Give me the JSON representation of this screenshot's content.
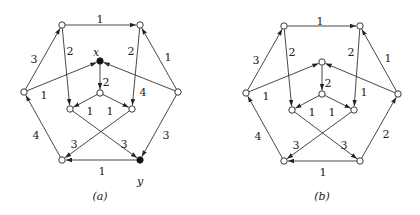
{
  "graphs": [
    {
      "id": "a",
      "caption": "(a)",
      "offset_x": 0,
      "nodes": [
        {
          "id": "tl",
          "x": 62,
          "y": 25,
          "filled": false
        },
        {
          "id": "tr",
          "x": 140,
          "y": 25,
          "filled": false
        },
        {
          "id": "l",
          "x": 24,
          "y": 92,
          "filled": false
        },
        {
          "id": "r",
          "x": 178,
          "y": 92,
          "filled": false
        },
        {
          "id": "x",
          "x": 100,
          "y": 61,
          "filled": true,
          "label": "x",
          "lx": 96,
          "ly": 53
        },
        {
          "id": "c",
          "x": 100,
          "y": 93,
          "filled": false
        },
        {
          "id": "il",
          "x": 70,
          "y": 109,
          "filled": false
        },
        {
          "id": "ir",
          "x": 132,
          "y": 109,
          "filled": false
        },
        {
          "id": "bl",
          "x": 62,
          "y": 160,
          "filled": false
        },
        {
          "id": "y",
          "x": 140,
          "y": 160,
          "filled": true,
          "label": "y",
          "lx": 140,
          "ly": 182
        }
      ],
      "edges": [
        {
          "from": "tl",
          "to": "tr",
          "w": "1",
          "lx": 100,
          "ly": 20
        },
        {
          "from": "l",
          "to": "tl",
          "w": "3",
          "lx": 34,
          "ly": 60
        },
        {
          "from": "r",
          "to": "tr",
          "w": "1",
          "lx": 168,
          "ly": 58
        },
        {
          "from": "tl",
          "to": "il",
          "w": "2",
          "lx": 70,
          "ly": 52
        },
        {
          "from": "tr",
          "to": "ir",
          "w": "2",
          "lx": 131,
          "ly": 52
        },
        {
          "from": "l",
          "to": "x",
          "w": "1",
          "lx": 44,
          "ly": 96
        },
        {
          "from": "r",
          "to": "x",
          "w": "4",
          "lx": 143,
          "ly": 93
        },
        {
          "from": "x",
          "to": "c",
          "w": "2",
          "lx": 106,
          "ly": 83
        },
        {
          "from": "c",
          "to": "il",
          "w": "1",
          "lx": 90,
          "ly": 112
        },
        {
          "from": "c",
          "to": "ir",
          "w": "1",
          "lx": 110,
          "ly": 112
        },
        {
          "from": "bl",
          "to": "l",
          "w": "4",
          "lx": 36,
          "ly": 136
        },
        {
          "from": "r",
          "to": "y",
          "w": "3",
          "lx": 166,
          "ly": 136
        },
        {
          "from": "il",
          "to": "y",
          "w": "3",
          "lx": 124,
          "ly": 145
        },
        {
          "from": "ir",
          "to": "bl",
          "w": "3",
          "lx": 74,
          "ly": 145
        },
        {
          "from": "y",
          "to": "bl",
          "w": "1",
          "lx": 102,
          "ly": 172
        }
      ]
    },
    {
      "id": "b",
      "caption": "(b)",
      "offset_x": 210,
      "nodes": [
        {
          "id": "tl",
          "x": 74,
          "y": 26,
          "filled": false
        },
        {
          "id": "tr",
          "x": 150,
          "y": 26,
          "filled": false
        },
        {
          "id": "l",
          "x": 36,
          "y": 93,
          "filled": false
        },
        {
          "id": "r",
          "x": 188,
          "y": 94,
          "filled": false
        },
        {
          "id": "t",
          "x": 112,
          "y": 62,
          "filled": false
        },
        {
          "id": "c",
          "x": 112,
          "y": 94,
          "filled": false
        },
        {
          "id": "il",
          "x": 82,
          "y": 110,
          "filled": false
        },
        {
          "id": "ir",
          "x": 144,
          "y": 110,
          "filled": false
        },
        {
          "id": "bl",
          "x": 74,
          "y": 161,
          "filled": false
        },
        {
          "id": "br",
          "x": 150,
          "y": 161,
          "filled": false
        }
      ],
      "edges": [
        {
          "from": "tl",
          "to": "tr",
          "w": "1",
          "lx": 110,
          "ly": 22
        },
        {
          "from": "l",
          "to": "tl",
          "w": "3",
          "lx": 46,
          "ly": 61
        },
        {
          "from": "r",
          "to": "tr",
          "w": "1",
          "lx": 178,
          "ly": 59
        },
        {
          "from": "tl",
          "to": "il",
          "w": "2",
          "lx": 82,
          "ly": 53
        },
        {
          "from": "tr",
          "to": "ir",
          "w": "2",
          "lx": 141,
          "ly": 53
        },
        {
          "from": "l",
          "to": "t",
          "w": "1",
          "lx": 56,
          "ly": 97
        },
        {
          "from": "r",
          "to": "t",
          "w": "1",
          "lx": 154,
          "ly": 93
        },
        {
          "from": "t",
          "to": "c",
          "w": "2",
          "lx": 118,
          "ly": 84
        },
        {
          "from": "c",
          "to": "il",
          "w": "1",
          "lx": 102,
          "ly": 113
        },
        {
          "from": "c",
          "to": "ir",
          "w": "1",
          "lx": 122,
          "ly": 113
        },
        {
          "from": "bl",
          "to": "l",
          "w": "4",
          "lx": 48,
          "ly": 137
        },
        {
          "from": "br",
          "to": "r",
          "w": "2",
          "lx": 176,
          "ly": 135
        },
        {
          "from": "il",
          "to": "br",
          "w": "3",
          "lx": 134,
          "ly": 146
        },
        {
          "from": "ir",
          "to": "bl",
          "w": "3",
          "lx": 86,
          "ly": 146
        },
        {
          "from": "br",
          "to": "bl",
          "w": "1",
          "lx": 113,
          "ly": 173
        }
      ]
    }
  ],
  "caption_y": 197
}
